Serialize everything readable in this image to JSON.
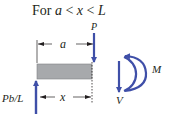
{
  "title": {
    "prefix": "For ",
    "var_a": "a",
    "op1": " < ",
    "var_x": "x",
    "op2": " < ",
    "var_L": "L"
  },
  "labels": {
    "load": "P",
    "dim_a": "a",
    "dim_x": "x",
    "reaction": "Pb/L",
    "shear": "V",
    "moment": "M"
  },
  "colors": {
    "arrow": "#3f4fa8",
    "beam_fill": "#a7a9ac",
    "beam_stroke": "#6d6e71",
    "dim_line": "#231f20"
  }
}
